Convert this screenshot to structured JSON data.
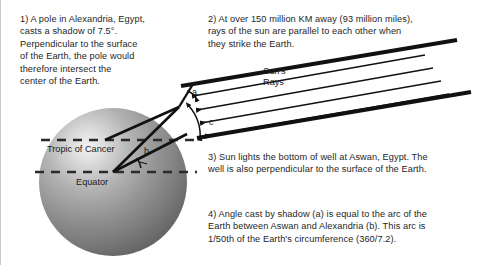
{
  "figure": {
    "background_color": "#ffffff",
    "text_color": "#252525"
  },
  "paragraphs": [
    {
      "id": "para-1",
      "number": "1)",
      "text": "1) A pole in Alexandria, Egypt,\ncasts a shadow of 7.5°.\nPerpendicular to the surface\nof the Earth, the pole would\ntherefore intersect the\ncenter of the Earth."
    },
    {
      "id": "para-2",
      "number": "2)",
      "text": "2) At over 150 million KM away (93 million miles),\nrays of the sun are parallel to each other when\nthey strike the Earth."
    },
    {
      "id": "para-3",
      "number": "3)",
      "text": "3) Sun lights the bottom of well at Aswan, Egypt.  The\nwell is also perpendicular to the surface of the Earth."
    },
    {
      "id": "para-4",
      "number": "4)",
      "text": "4) Angle cast by shadow (a) is equal to the arc of the\nEarth between Aswan and Alexandria (b). This arc is\n1/50th of the Earth's circumference (360/7.2)."
    }
  ],
  "diagram": {
    "earth": {
      "label": "Earth sphere",
      "fill_light": "#f2f2f2",
      "fill_mid": "#9a9a9a",
      "fill_dark": "#4a4a4a",
      "center_x": 112,
      "center_y": 182,
      "radius": 74
    },
    "lines": [
      {
        "name": "tropic-of-cancer-line",
        "label": "Tropic of Cancer",
        "y": 140,
        "style": "dashed"
      },
      {
        "name": "equator-line",
        "label": "Equator",
        "y": 172,
        "style": "dashed"
      }
    ],
    "labels": {
      "tropic_of_cancer": "Tropic of Cancer",
      "equator": "Equator",
      "suns_rays": "Sun's\nRays",
      "angle_a": "a",
      "angle_b": "b",
      "angle_c": "c"
    },
    "sun_rays": {
      "name": "parallel-sun-rays",
      "count": 4,
      "direction": "down-left",
      "color": "#111111"
    },
    "colors": {
      "stroke": "#111111",
      "dash": "#2b2b2b"
    }
  }
}
